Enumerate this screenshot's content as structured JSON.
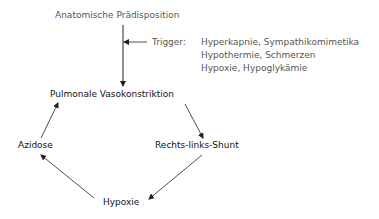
{
  "diagram": {
    "top_node": "Anatomische Prädisposition",
    "trigger_label": "Trigger:",
    "trigger_items": [
      "Hyperkapnie, Sympathikomimetika",
      "Hypothermie, Schmerzen",
      "Hypoxie, Hypoglykämie"
    ],
    "cycle": {
      "vasokonstriktion": "Pulmonale Vasokonstriktion",
      "shunt": "Rechts-links-Shunt",
      "hypoxie": "Hypoxie",
      "azidose": "Azidose"
    },
    "colors": {
      "secondary_text": "#555555",
      "primary_text": "#111111",
      "arrow": "#222222"
    }
  }
}
